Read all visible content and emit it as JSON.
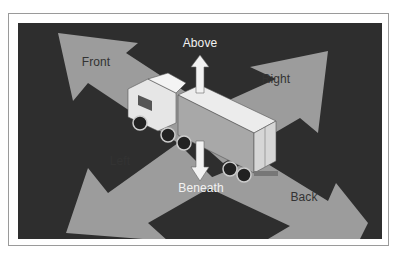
{
  "figure": {
    "colors": {
      "background": "#2e2e2e",
      "arrow_fill": "#9c9c9c",
      "vertical_arrow": "#f2f2f2",
      "truck_body": "#e6e6e6",
      "truck_side": "#a8a8a8",
      "label_dark": "#333333",
      "label_light": "#f2f2f2"
    },
    "labels": {
      "front": "Front",
      "above": "Above",
      "right": "Right",
      "left": "Left",
      "beneath": "Beneath",
      "back": "Back"
    },
    "icons": {
      "arrows": [
        "arrow-front-icon",
        "arrow-right-icon",
        "arrow-left-icon",
        "arrow-back-icon",
        "arrow-up-icon",
        "arrow-down-icon"
      ],
      "truck": "semi-truck-icon"
    }
  }
}
